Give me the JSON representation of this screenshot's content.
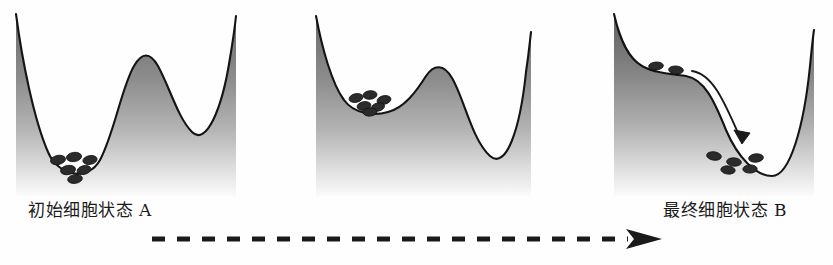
{
  "figure": {
    "background_color": "#ffffff",
    "line_color": "#141414",
    "hill_fill_dark": "#6e6e6e",
    "hill_fill_light": "#ffffff",
    "cell_color": "#2b2b2b",
    "arrow_color": "#1a1a1a"
  },
  "captions": {
    "initial_state": "初始细胞状态 A",
    "final_state": "最终细胞状态 B",
    "flow_note": ""
  },
  "panels": [
    {
      "id": "panel-a",
      "name": "initial-landscape",
      "description": "Deep left valley holding the cell population, tall central barrier, shallower right valley",
      "valleys": [
        {
          "position": 0.28,
          "depth": 0.86,
          "occupied": true,
          "cell_count": 6
        },
        {
          "position": 0.8,
          "depth": 0.58,
          "occupied": false,
          "cell_count": 0
        }
      ],
      "barrier": {
        "position": 0.55,
        "height": 0.72
      },
      "cells": [
        {
          "x": 58,
          "y": 160
        },
        {
          "x": 72,
          "y": 157
        },
        {
          "x": 86,
          "y": 161
        },
        {
          "x": 66,
          "y": 169
        },
        {
          "x": 80,
          "y": 170
        },
        {
          "x": 73,
          "y": 176
        }
      ]
    },
    {
      "id": "panel-b",
      "name": "intermediate-landscape",
      "description": "Left valley flattened and raised, central barrier lowered, right valley deepened",
      "valleys": [
        {
          "position": 0.26,
          "depth": 0.44,
          "occupied": true,
          "cell_count": 6
        },
        {
          "position": 0.78,
          "depth": 0.9,
          "occupied": false,
          "cell_count": 0
        }
      ],
      "barrier": {
        "position": 0.52,
        "height": 0.5
      },
      "cells": [
        {
          "x": 44,
          "y": 96
        },
        {
          "x": 58,
          "y": 92
        },
        {
          "x": 72,
          "y": 97
        },
        {
          "x": 52,
          "y": 104
        },
        {
          "x": 66,
          "y": 105
        },
        {
          "x": 59,
          "y": 110
        }
      ]
    },
    {
      "id": "panel-c",
      "name": "final-landscape",
      "description": "Left valley erased into a shoulder, cells roll down the slope into the single deep right valley",
      "valleys": [
        {
          "position": 0.25,
          "depth": 0.1,
          "occupied": true,
          "cell_count": 2
        },
        {
          "position": 0.72,
          "depth": 1.0,
          "occupied": true,
          "cell_count": 5
        }
      ],
      "barrier": {
        "position": 0.0,
        "height": 0.0
      },
      "cells_shoulder": [
        {
          "x": 60,
          "y": 64
        },
        {
          "x": 82,
          "y": 69
        }
      ],
      "cells_well": [
        {
          "x": 116,
          "y": 154
        },
        {
          "x": 136,
          "y": 160
        },
        {
          "x": 156,
          "y": 156
        },
        {
          "x": 130,
          "y": 168
        },
        {
          "x": 150,
          "y": 167
        }
      ],
      "transition_arrow": {
        "label": "roll-down-arrow",
        "direction": "down-right"
      }
    }
  ],
  "flow_arrow": {
    "name": "progression-arrow",
    "style": "dashed",
    "direction": "left-to-right",
    "dash_count": 19,
    "color": "#1a1a1a"
  }
}
